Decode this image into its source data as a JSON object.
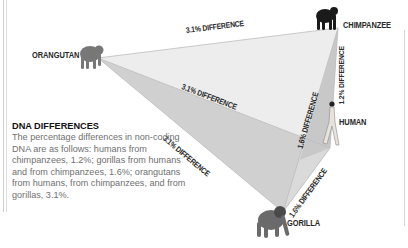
{
  "species": {
    "orangutan": "ORANGUTAN",
    "chimpanzee": "CHIMPANZEE",
    "human": "HUMAN",
    "gorilla": "GORILLA"
  },
  "edges": {
    "orangutan_chimpanzee": "3.1% DIFFERENCE",
    "orangutan_human": "3.1% DIFFERENCE",
    "orangutan_gorilla": "3.1% DIFFERENCE",
    "chimpanzee_human": "1.2% DIFFERENCE",
    "chimpanzee_gorilla": "1.6% DIFFERENCE",
    "human_gorilla": "1.6% DIFFERENCE"
  },
  "info": {
    "title": "DNA DIFFERENCES",
    "body": "The percentage differences in non-coding DNA are as follows: humans from chimpanzees, 1.2%; gorillas from humans and from chimpanzees, 1.6%; orangutans from humans, from chimpanzees, and from gorillas, 3.1%."
  },
  "colors": {
    "upper_face": "#ececec",
    "lower_face": "#cfcfcf",
    "right_face": "#e4e4e4",
    "edge_line": "#bdbdbd",
    "figure": "#6e6e6e"
  }
}
